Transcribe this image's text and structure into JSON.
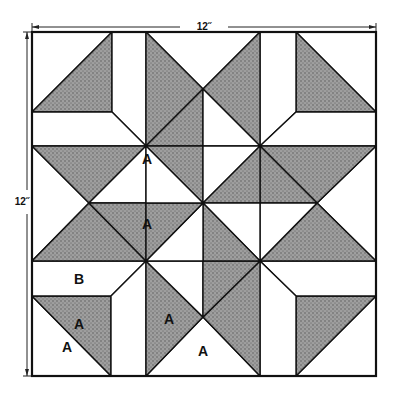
{
  "diagram": {
    "type": "quilt-block-pattern",
    "dimensions": {
      "width_label": "12˝",
      "height_label": "12˝"
    },
    "colors": {
      "shaded": "#8a8a8a",
      "unshaded": "#ffffff",
      "outline": "#111111"
    },
    "piece_labels": [
      {
        "text": "A",
        "x": 147,
        "y": 160,
        "note": "white triangle, upper-left of center"
      },
      {
        "text": "A",
        "x": 147,
        "y": 225,
        "note": "shaded triangle, left of center"
      },
      {
        "text": "B",
        "x": 79,
        "y": 280,
        "note": "white rectangle strip, bottom-left corner unit"
      },
      {
        "text": "A",
        "x": 79,
        "y": 325,
        "note": "shaded triangle, bottom-left corner unit"
      },
      {
        "text": "A",
        "x": 67,
        "y": 348,
        "note": "white triangle, bottom-left corner unit"
      },
      {
        "text": "A",
        "x": 169,
        "y": 320,
        "note": "shaded triangle, bottom-middle"
      },
      {
        "text": "A",
        "x": 203,
        "y": 352,
        "note": "white triangle, bottom-middle"
      }
    ]
  }
}
